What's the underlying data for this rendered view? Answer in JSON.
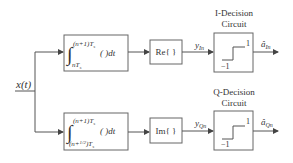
{
  "input": {
    "label": "x(t)"
  },
  "i_branch": {
    "integrator": {
      "upper_limit": "(n+1)T",
      "upper_sub": "s",
      "lower_limit": "nT",
      "lower_sub": "s",
      "integrand": "(   )dt"
    },
    "extract": {
      "label": "Re{ }"
    },
    "output_y": {
      "main": "y",
      "sub": "In"
    },
    "decision": {
      "title_line1": "I-Decision",
      "title_line2": "Circuit",
      "high": "1",
      "low": "−1"
    },
    "output_a": {
      "main": "â",
      "sub": "In"
    }
  },
  "q_branch": {
    "integrator": {
      "upper_limit": "(n+1)T",
      "upper_sub": "s",
      "lower_limit": "(n+",
      "lower_frac": "1/2",
      "lower_end": ")T",
      "lower_sub": "s",
      "integrand": "(   )dt"
    },
    "extract": {
      "label": "Im{ }"
    },
    "output_y": {
      "main": "y",
      "sub": "Qn"
    },
    "decision": {
      "title_line1": "Q-Decision",
      "title_line2": "Circuit",
      "high": "1",
      "low": "−1"
    },
    "output_a": {
      "main": "â",
      "sub": "Qn"
    }
  }
}
